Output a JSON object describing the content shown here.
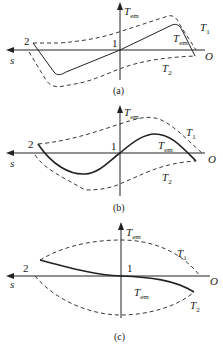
{
  "figure": {
    "axis_labels": {
      "vertical": "T",
      "vertical_sub": "em",
      "horizontal": "s",
      "origin": "O"
    },
    "point_labels": {
      "p1": "1",
      "p2": "2"
    },
    "curve_labels": {
      "T1": "T",
      "T1_sub": "1",
      "T2": "T",
      "T2_sub": "2",
      "Tem": "T",
      "Tem_sub": "em"
    },
    "panels": [
      {
        "id": "a",
        "caption": "(a)",
        "description": "Linear/trapezoidal Tem characteristic between dashed envelopes T1 and T2"
      },
      {
        "id": "b",
        "caption": "(b)",
        "description": "Sinusoidal-like Tem characteristic between dashed envelopes T1 and T2"
      },
      {
        "id": "c",
        "caption": "(c)",
        "description": "Tem characteristic decreasing from point 2 through 1 toward T2 between lens-shaped envelopes"
      }
    ],
    "colors": {
      "line": "#222222",
      "background": "#ffffff"
    }
  }
}
